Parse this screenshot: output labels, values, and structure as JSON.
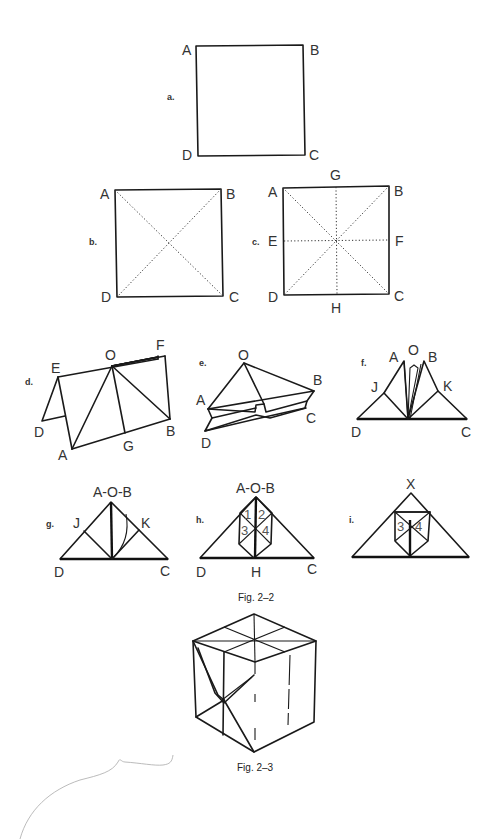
{
  "figures": {
    "fig_2_2": {
      "caption": "Fig. 2–2",
      "steps": {
        "a": {
          "label": "a.",
          "corners": {
            "tl": "A",
            "tr": "B",
            "bl": "D",
            "br": "C"
          }
        },
        "b": {
          "label": "b.",
          "corners": {
            "tl": "A",
            "tr": "B",
            "bl": "D",
            "br": "C"
          }
        },
        "c": {
          "label": "c.",
          "corners": {
            "tl": "A",
            "tr": "B",
            "bl": "D",
            "br": "C"
          },
          "mid": {
            "top": "G",
            "left": "E",
            "right": "F",
            "bottom": "H"
          }
        },
        "d": {
          "label": "d.",
          "points": {
            "E": "E",
            "O": "O",
            "F": "F",
            "D": "D",
            "A": "A",
            "G": "G",
            "B": "B"
          }
        },
        "e": {
          "label": "e.",
          "points": {
            "O": "O",
            "A": "A",
            "B": "B",
            "C": "C",
            "D": "D"
          }
        },
        "f": {
          "label": "f.",
          "points": {
            "A": "A",
            "O": "O",
            "B": "B",
            "J": "J",
            "K": "K",
            "D": "D",
            "C": "C"
          }
        },
        "g": {
          "label": "g.",
          "points": {
            "top": "A-O-B",
            "J": "J",
            "K": "K",
            "D": "D",
            "C": "C"
          }
        },
        "h": {
          "label": "h.",
          "points": {
            "top": "A-O-B",
            "D": "D",
            "H": "H",
            "C": "C"
          },
          "numbers": [
            "1",
            "2",
            "3",
            "4"
          ]
        },
        "i": {
          "label": "i.",
          "points": {
            "top": "X"
          },
          "numbers": [
            "3",
            "4"
          ]
        }
      }
    },
    "fig_2_3": {
      "caption": "Fig. 2–3"
    }
  }
}
